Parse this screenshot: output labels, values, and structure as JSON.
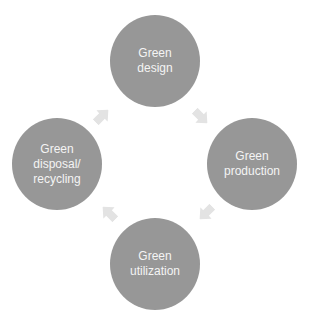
{
  "diagram": {
    "type": "cycle",
    "colors": {
      "node_fill": "#979797",
      "node_text": "#f4f4f4",
      "arrow_fill": "#e3e3e3",
      "background": "#ffffff"
    },
    "nodes": [
      {
        "id": "design",
        "label": "Green\ndesign",
        "position": "top"
      },
      {
        "id": "production",
        "label": "Green\nproduction",
        "position": "right"
      },
      {
        "id": "utilization",
        "label": "Green\nutilization",
        "position": "bottom"
      },
      {
        "id": "disposal",
        "label": "Green\ndisposal/\nrecycling",
        "position": "left"
      }
    ],
    "edges": [
      {
        "from": "design",
        "to": "production",
        "icon": "arrow-down-right-icon"
      },
      {
        "from": "production",
        "to": "utilization",
        "icon": "arrow-down-left-icon"
      },
      {
        "from": "utilization",
        "to": "disposal",
        "icon": "arrow-up-left-icon"
      },
      {
        "from": "disposal",
        "to": "design",
        "icon": "arrow-up-right-icon"
      }
    ]
  }
}
